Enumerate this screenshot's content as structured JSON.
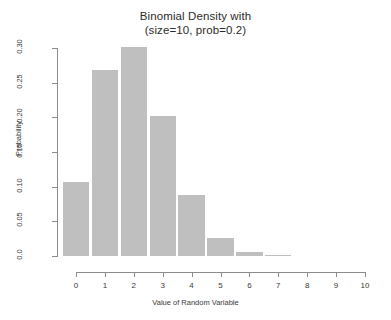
{
  "chart_data": {
    "type": "bar",
    "title": "Binomial Density with",
    "subtitle": "(size=10, prob=0.2)",
    "title_lines": [
      "Binomial Density with",
      "(size=10, prob=0.2)"
    ],
    "xlabel": "Value of Random Variable",
    "ylabel": "Probability",
    "categories": [
      "0",
      "1",
      "2",
      "3",
      "4",
      "5",
      "6",
      "7",
      "8",
      "9",
      "10"
    ],
    "x": [
      0,
      1,
      2,
      3,
      4,
      5,
      6,
      7,
      8,
      9,
      10
    ],
    "values": [
      0.1074,
      0.2684,
      0.302,
      0.2013,
      0.0881,
      0.0264,
      0.0055,
      0.0008,
      0.0001,
      0.0,
      0.0
    ],
    "xlim": [
      0,
      10
    ],
    "ylim": [
      0.0,
      0.3
    ],
    "xticks": [
      0,
      1,
      2,
      3,
      4,
      5,
      6,
      7,
      8,
      9,
      10
    ],
    "xtick_labels": [
      "0",
      "1",
      "2",
      "3",
      "4",
      "5",
      "6",
      "7",
      "8",
      "9",
      "10"
    ],
    "yticks": [
      0.0,
      0.05,
      0.1,
      0.15,
      0.2,
      0.25,
      0.3
    ],
    "ytick_labels": [
      "0.0",
      "0.05",
      "0.10",
      "0.15",
      "0.20",
      "0.25",
      "0.30"
    ],
    "grid": false,
    "legend": false,
    "bar_color": "#bfbfbf",
    "axis_color": "#8c8c8c",
    "text_color": "#3a3a3a",
    "background": "#ffffff"
  }
}
